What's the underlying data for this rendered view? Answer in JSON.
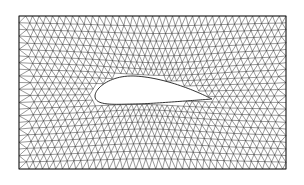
{
  "figure": {
    "background": "#ffffff",
    "line_color": "#1a1a1a",
    "domain_box": {
      "x0": 19,
      "y0": 16,
      "x1": 286,
      "y1": 169
    },
    "airfoil": {
      "leading_edge": [
        95,
        96
      ],
      "trailing_edge": [
        212,
        99
      ],
      "chord_px": 117,
      "max_thickness_px": 30,
      "fill": "#ffffff"
    },
    "grid": {
      "cols": 40,
      "rows": 23
    }
  }
}
